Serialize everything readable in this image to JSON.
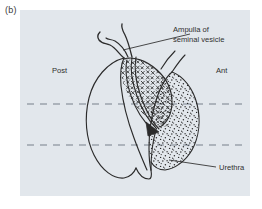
{
  "figure": {
    "panel_label": "(b)",
    "panel_bg_color": "#e2e7ec",
    "ink_color": "#2b2b2b",
    "dashed_line_color": "#9aa3ab",
    "text_color": "#2f2f2f"
  },
  "labels": {
    "posterior": "Post",
    "anterior": "Ant",
    "ampulla_line1": "Ampulla of",
    "ampulla_line2": "seminal vesicle",
    "urethra": "Urethra"
  },
  "regions": {
    "posterior_lobe": "posterior-lobe-plain",
    "central_zone": "central-zone-crosshatch",
    "anterior_zone": "anterior-zone-stipple",
    "wedge_zone": "wedge-diagonal-hatch"
  },
  "guides": {
    "dashed_line_upper_y": 94,
    "dashed_line_lower_y": 135,
    "dashed_count": 2
  },
  "leaders": {
    "ampulla_leader": "leader-line-ampulla",
    "urethra_leader": "leader-line-urethra"
  }
}
